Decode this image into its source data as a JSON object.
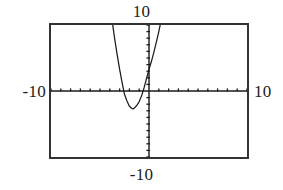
{
  "figure": {
    "caption_title": "",
    "background_color": "#ffffff",
    "ink_color": "#1b1b1b"
  },
  "labels": {
    "y_max": "10",
    "y_min": "-10",
    "x_min": "-10",
    "x_max": "10"
  },
  "chart_data": {
    "type": "line",
    "title": "",
    "xlabel": "",
    "ylabel": "",
    "xlim": [
      -10,
      10
    ],
    "ylim": [
      -10,
      10
    ],
    "grid": false,
    "legend": null,
    "axis_style": "calculator-window-with-tick-marks",
    "x_tick_step": 1,
    "y_tick_step": 1,
    "tick_labels": {
      "x": [
        "-10",
        "10"
      ],
      "y": [
        "-10",
        "10"
      ]
    },
    "annotations": [],
    "series": [
      {
        "name": "parabola",
        "style": "solid",
        "color": "#1b1b1b",
        "roots": [
          -3.0,
          -0.3
        ],
        "vertex": [
          -1.65,
          -2.7
        ],
        "opens": "up",
        "x": [
          -3.75,
          -3.5,
          -3.25,
          -3.0,
          -2.75,
          -2.5,
          -2.25,
          -2.0,
          -1.75,
          -1.65,
          -1.5,
          -1.25,
          -1.0,
          -0.75,
          -0.5,
          -0.3,
          0.0,
          0.25,
          0.5,
          0.75,
          1.0,
          1.25,
          1.5,
          1.65
        ],
        "y": [
          10.5,
          7.9,
          5.5,
          3.3,
          1.3,
          -0.5,
          -1.5,
          -2.3,
          -2.65,
          -2.7,
          -2.6,
          -2.2,
          -1.6,
          -0.7,
          0.5,
          1.6,
          3.3,
          4.5,
          5.9,
          7.4,
          9.0,
          10.8,
          12.7,
          13.8
        ],
        "equation_fit": "y ≈ 4.0*(x + 1.65)^2 - 2.7"
      }
    ]
  }
}
